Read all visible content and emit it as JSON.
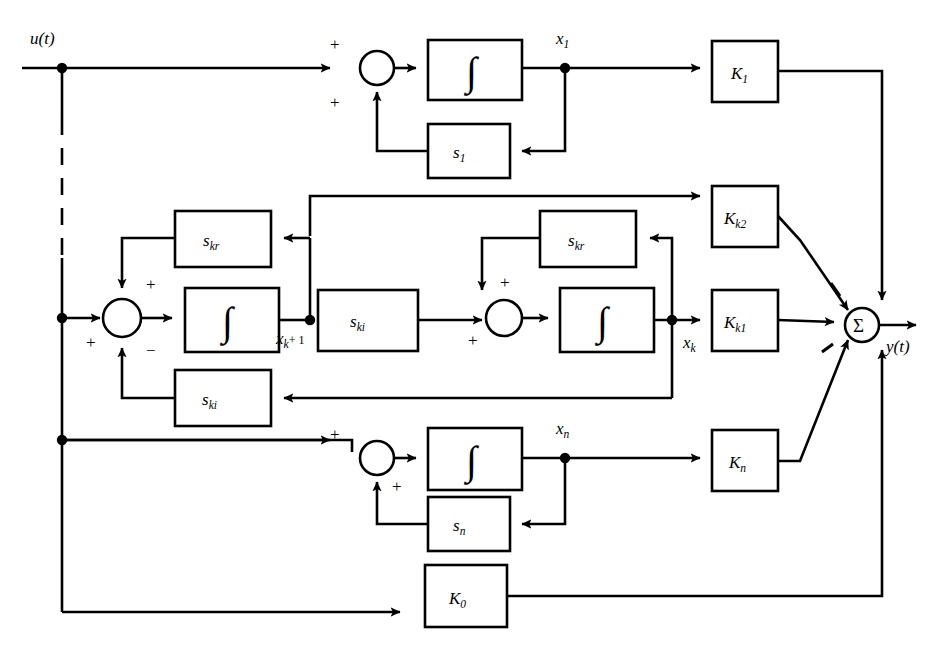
{
  "diagram": {
    "type": "control-system-block-diagram",
    "input_label": "u(t)",
    "output_label": "y(t)",
    "summing_node_symbol": "Σ",
    "integrator_symbol": "∫",
    "colors": {
      "line": "#000000",
      "background": "#ffffff",
      "block_fill": "#ffffff"
    },
    "signs": {
      "plus": "+",
      "minus": "−"
    },
    "state_labels": {
      "x1": "x",
      "x1_sub": "1",
      "xk1": "x",
      "xk1_sub": "k",
      "xk1_tail": "+ 1",
      "xk": "x",
      "xk_sub": "k",
      "xn": "x",
      "xn_sub": "n"
    },
    "gain_blocks": [
      {
        "name": "K1",
        "base": "K",
        "sub": "1",
        "x": 712,
        "y": 41,
        "w": 66,
        "h": 61
      },
      {
        "name": "Kk2",
        "base": "K",
        "sub": "k2",
        "x": 712,
        "y": 186,
        "w": 66,
        "h": 61
      },
      {
        "name": "Kk1",
        "base": "K",
        "sub": "k1",
        "x": 712,
        "y": 290,
        "w": 66,
        "h": 61
      },
      {
        "name": "Kn",
        "base": "K",
        "sub": "n",
        "x": 712,
        "y": 430,
        "w": 66,
        "h": 61
      },
      {
        "name": "K0",
        "base": "K",
        "sub": "0",
        "x": 425,
        "y": 565,
        "w": 82,
        "h": 62
      }
    ],
    "feedback_blocks": [
      {
        "name": "s1",
        "base": "s",
        "sub": "1",
        "x": 428,
        "y": 124,
        "w": 82,
        "h": 54
      },
      {
        "name": "skr_L",
        "base": "s",
        "sub": "kr",
        "x": 175,
        "y": 211,
        "w": 96,
        "h": 56
      },
      {
        "name": "ski_F",
        "base": "s",
        "sub": "ki",
        "x": 318,
        "y": 290,
        "w": 100,
        "h": 61
      },
      {
        "name": "ski_B",
        "base": "s",
        "sub": "ki",
        "x": 175,
        "y": 370,
        "w": 96,
        "h": 56
      },
      {
        "name": "skr_R",
        "base": "s",
        "sub": "kr",
        "x": 540,
        "y": 211,
        "w": 96,
        "h": 56
      },
      {
        "name": "sn",
        "base": "s",
        "sub": "n",
        "x": 428,
        "y": 497,
        "w": 82,
        "h": 54
      }
    ],
    "integrators": [
      {
        "name": "integrator-1",
        "x": 428,
        "y": 40,
        "w": 94,
        "h": 60
      },
      {
        "name": "integrator-k1",
        "x": 185,
        "y": 288,
        "w": 94,
        "h": 64
      },
      {
        "name": "integrator-k",
        "x": 560,
        "y": 288,
        "w": 94,
        "h": 64
      },
      {
        "name": "integrator-n",
        "x": 428,
        "y": 428,
        "w": 94,
        "h": 62
      }
    ],
    "summing_junctions": [
      {
        "name": "summer-1",
        "cx": 377,
        "cy": 68,
        "r": 17
      },
      {
        "name": "summer-k1",
        "cx": 122,
        "cy": 318,
        "r": 19
      },
      {
        "name": "summer-k",
        "cx": 504,
        "cy": 318,
        "r": 18
      },
      {
        "name": "summer-n",
        "cx": 377,
        "cy": 458,
        "r": 17
      },
      {
        "name": "output-summer",
        "cx": 862,
        "cy": 325,
        "r": 17
      }
    ],
    "ghost_text": ""
  }
}
